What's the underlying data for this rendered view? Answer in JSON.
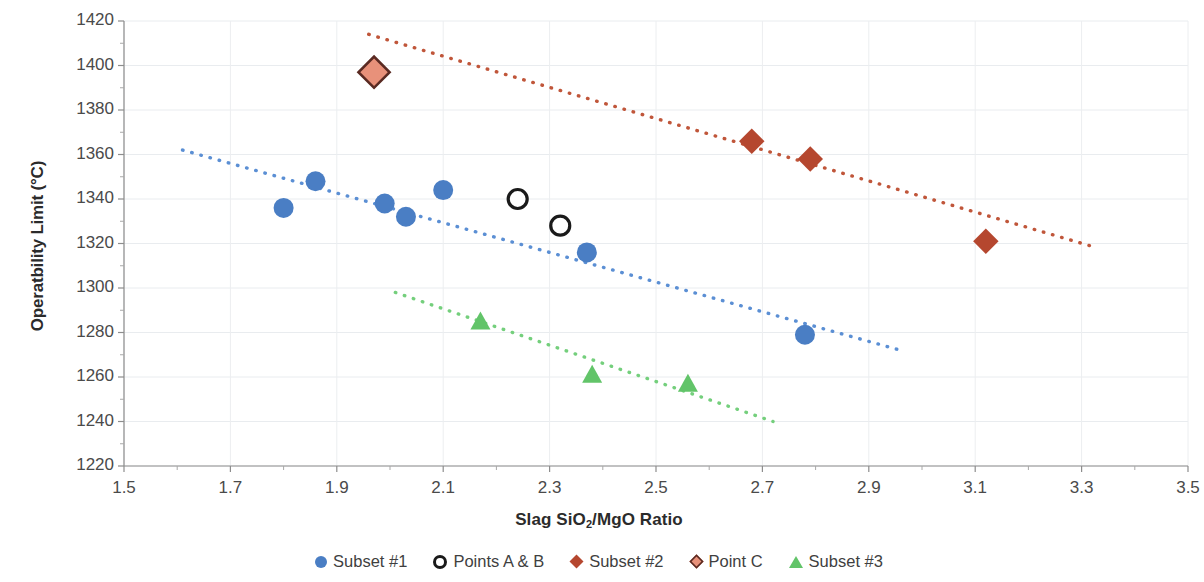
{
  "chart_data": {
    "type": "scatter",
    "title": "",
    "xlabel": "Slag SiO2/MgO Ratio",
    "xlabel_html": "Slag SiO<sub>2</sub>/MgO Ratio",
    "ylabel": "Operatbility Limit (°C)",
    "xlim": [
      1.5,
      3.5
    ],
    "ylim": [
      1220,
      1420
    ],
    "xticks": [
      "1.5",
      "1.7",
      "1.9",
      "2.1",
      "2.3",
      "2.5",
      "2.7",
      "2.9",
      "3.1",
      "3.3",
      "3.5"
    ],
    "xtick_values": [
      1.5,
      1.7,
      1.9,
      2.1,
      2.3,
      2.5,
      2.7,
      2.9,
      3.1,
      3.3,
      3.5
    ],
    "xtick_minor_step": 0.1,
    "yticks": [
      "1220",
      "1240",
      "1260",
      "1280",
      "1300",
      "1320",
      "1340",
      "1360",
      "1380",
      "1400",
      "1420"
    ],
    "ytick_values": [
      1220,
      1240,
      1260,
      1280,
      1300,
      1320,
      1340,
      1360,
      1380,
      1400,
      1420
    ],
    "ytick_minor_step": 10,
    "grid": "horizontal-and-vertical-faint",
    "legend_position": "bottom",
    "series": [
      {
        "name": "Subset #1",
        "marker": "circle",
        "color": "#4a7ec4",
        "points": [
          {
            "x": 1.8,
            "y": 1336
          },
          {
            "x": 1.86,
            "y": 1348
          },
          {
            "x": 1.99,
            "y": 1338
          },
          {
            "x": 2.03,
            "y": 1332
          },
          {
            "x": 2.1,
            "y": 1344
          },
          {
            "x": 2.37,
            "y": 1316
          },
          {
            "x": 2.78,
            "y": 1279
          }
        ],
        "trendline": {
          "x1": 1.61,
          "y1": 1362,
          "x2": 2.96,
          "y2": 1272,
          "style": "dotted",
          "color": "#5b8fd4"
        }
      },
      {
        "name": "Points A & B",
        "marker": "open-circle",
        "color": "#1a1a1a",
        "points": [
          {
            "x": 2.24,
            "y": 1340
          },
          {
            "x": 2.32,
            "y": 1328
          }
        ],
        "trendline": null
      },
      {
        "name": "Subset #2",
        "marker": "diamond",
        "color": "#b5472f",
        "points": [
          {
            "x": 2.68,
            "y": 1366
          },
          {
            "x": 2.79,
            "y": 1358
          },
          {
            "x": 3.12,
            "y": 1321
          }
        ],
        "trendline": {
          "x1": 1.96,
          "y1": 1414,
          "x2": 3.33,
          "y2": 1318,
          "style": "dotted",
          "color": "#c0563a"
        }
      },
      {
        "name": "Point C",
        "marker": "diamond-outlined",
        "color": "#e8917a",
        "edge_color": "#5a2a22",
        "points": [
          {
            "x": 1.97,
            "y": 1397
          }
        ],
        "trendline": null
      },
      {
        "name": "Subset #3",
        "marker": "triangle",
        "color": "#62c469",
        "points": [
          {
            "x": 2.17,
            "y": 1285
          },
          {
            "x": 2.38,
            "y": 1261
          },
          {
            "x": 2.56,
            "y": 1257
          }
        ],
        "trendline": {
          "x1": 2.01,
          "y1": 1298,
          "x2": 2.72,
          "y2": 1240,
          "style": "dotted",
          "color": "#74cf7c"
        }
      }
    ]
  },
  "legend": {
    "items": [
      {
        "label": "Subset #1",
        "marker": "circle",
        "color": "#4a7ec4"
      },
      {
        "label": "Points A & B",
        "marker": "open-circle",
        "color": "#1a1a1a"
      },
      {
        "label": "Subset #2",
        "marker": "diamond",
        "color": "#b5472f"
      },
      {
        "label": "Point C",
        "marker": "diamond-outlined",
        "color": "#e8917a"
      },
      {
        "label": "Subset #3",
        "marker": "triangle",
        "color": "#62c469"
      }
    ]
  }
}
